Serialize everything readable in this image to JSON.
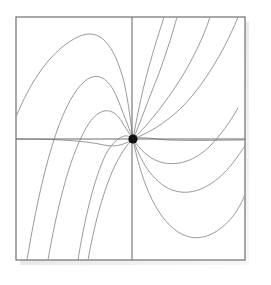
{
  "figure": {
    "title": "",
    "kind": "phase-portrait",
    "background_color": "#ffffff",
    "frame": {
      "x": 16,
      "y": 17,
      "width": 229,
      "height": 243,
      "border_color": "#6f6f6f",
      "fill_color": "#ffffff",
      "shadow_color": "#c9c9c9",
      "shadow_offset_x": 4,
      "shadow_offset_y": 5
    },
    "axes": {
      "color": "#6f6f6f",
      "x_axis_y": 139,
      "y_axis_x": 132,
      "stroke_width": 1.1
    },
    "singular_point": {
      "label": "origin",
      "x": 133,
      "y": 139,
      "radius": 4.6,
      "color": "#111111"
    },
    "curve_style": {
      "color": "#9a9a9a",
      "stroke_width": 1.0,
      "fill": "none"
    }
  },
  "chart_data": {
    "type": "line",
    "title": "",
    "xlabel": "",
    "ylabel": "",
    "grid": false,
    "legend": null,
    "xlim": [
      16,
      245
    ],
    "ylim": [
      260,
      17
    ],
    "origin": [
      133,
      139
    ],
    "series": [
      {
        "name": "upper-left-outer",
        "quadrant": "upper-left",
        "path": "M 16 117 C 30 82 52 48 80 36 C 100 28 114 44 124 82 C 129 104 131 126 133 139",
        "points": [
          [
            16,
            117
          ],
          [
            40,
            70
          ],
          [
            62,
            44
          ],
          [
            82,
            36
          ],
          [
            100,
            44
          ],
          [
            114,
            72
          ],
          [
            124,
            104
          ],
          [
            133,
            139
          ]
        ]
      },
      {
        "name": "upper-left-mid",
        "quadrant": "upper-left",
        "path": "M 27 260 C 37 200 52 128 74 94 C 92 66 108 74 118 100 C 126 120 130 131 133 139",
        "points": [
          [
            27,
            260
          ],
          [
            40,
            206
          ],
          [
            56,
            146
          ],
          [
            74,
            102
          ],
          [
            94,
            76
          ],
          [
            110,
            88
          ],
          [
            122,
            114
          ],
          [
            133,
            139
          ]
        ]
      },
      {
        "name": "upper-left-inner",
        "quadrant": "upper-left",
        "path": "M 48 260 C 56 214 68 160 86 128 C 100 104 114 108 122 122 C 128 132 131 136 133 139",
        "points": [
          [
            48,
            260
          ],
          [
            58,
            212
          ],
          [
            72,
            162
          ],
          [
            88,
            128
          ],
          [
            104,
            112
          ],
          [
            118,
            120
          ],
          [
            126,
            130
          ],
          [
            133,
            139
          ]
        ]
      },
      {
        "name": "upper-left-innermost",
        "quadrant": "upper-left",
        "path": "M 78 260 C 84 222 94 178 106 154 C 116 136 126 134 130 137 C 132 138 132 139 133 139",
        "points": [
          [
            78,
            260
          ],
          [
            86,
            220
          ],
          [
            96,
            180
          ],
          [
            108,
            154
          ],
          [
            120,
            140
          ],
          [
            128,
            137
          ],
          [
            133,
            139
          ]
        ]
      },
      {
        "name": "lower-left-outer",
        "quadrant": "lower-left",
        "path": "M 88 260 C 94 226 102 196 112 172 C 120 154 128 143 133 139",
        "points": [
          [
            88,
            260
          ],
          [
            96,
            224
          ],
          [
            106,
            190
          ],
          [
            116,
            164
          ],
          [
            126,
            147
          ],
          [
            133,
            139
          ]
        ]
      },
      {
        "name": "left-separatrix",
        "quadrant": "left",
        "path": "M 16 139 C 48 139 82 140 104 145 C 118 148 127 143 133 139",
        "points": [
          [
            16,
            139
          ],
          [
            48,
            139
          ],
          [
            78,
            141
          ],
          [
            100,
            146
          ],
          [
            118,
            146
          ],
          [
            133,
            139
          ]
        ]
      },
      {
        "name": "right-separatrix",
        "quadrant": "right",
        "path": "M 133 139 C 142 136 152 139 168 140 C 196 141 224 140 245 140",
        "points": [
          [
            133,
            139
          ],
          [
            148,
            138
          ],
          [
            168,
            140
          ],
          [
            200,
            141
          ],
          [
            245,
            140
          ]
        ]
      },
      {
        "name": "upper-right-innermost",
        "quadrant": "upper-right",
        "path": "M 133 139 C 136 122 141 96 148 70 C 154 48 160 30 164 17",
        "points": [
          [
            133,
            139
          ],
          [
            138,
            110
          ],
          [
            145,
            80
          ],
          [
            154,
            48
          ],
          [
            164,
            17
          ]
        ]
      },
      {
        "name": "upper-right-inner",
        "quadrant": "upper-right",
        "path": "M 133 139 C 140 124 148 100 158 76 C 166 54 173 32 177 17",
        "points": [
          [
            133,
            139
          ],
          [
            142,
            116
          ],
          [
            152,
            90
          ],
          [
            164,
            58
          ],
          [
            177,
            17
          ]
        ]
      },
      {
        "name": "upper-right-mid",
        "quadrant": "upper-right",
        "path": "M 133 139 C 145 128 160 110 176 86 C 192 62 204 36 210 17",
        "points": [
          [
            133,
            139
          ],
          [
            150,
            122
          ],
          [
            168,
            96
          ],
          [
            186,
            66
          ],
          [
            200,
            40
          ],
          [
            210,
            17
          ]
        ]
      },
      {
        "name": "upper-right-outer",
        "quadrant": "upper-right",
        "path": "M 133 139 C 152 132 174 118 192 96 C 212 72 228 42 238 17",
        "points": [
          [
            133,
            139
          ],
          [
            158,
            128
          ],
          [
            180,
            108
          ],
          [
            200,
            82
          ],
          [
            220,
            50
          ],
          [
            238,
            17
          ]
        ]
      },
      {
        "name": "lower-right-inner",
        "quadrant": "lower-right",
        "path": "M 133 139 C 140 150 150 160 164 163 C 182 166 198 158 210 146 C 220 136 230 122 238 108",
        "points": [
          [
            133,
            139
          ],
          [
            146,
            157
          ],
          [
            164,
            163
          ],
          [
            186,
            161
          ],
          [
            206,
            150
          ],
          [
            224,
            130
          ],
          [
            238,
            108
          ]
        ]
      },
      {
        "name": "lower-right-mid",
        "quadrant": "lower-right",
        "path": "M 133 139 C 140 160 152 182 172 190 C 194 198 216 184 232 164 C 238 156 242 150 245 146",
        "points": [
          [
            133,
            139
          ],
          [
            148,
            172
          ],
          [
            168,
            188
          ],
          [
            192,
            193
          ],
          [
            214,
            182
          ],
          [
            234,
            160
          ],
          [
            245,
            146
          ]
        ]
      },
      {
        "name": "lower-right-outer",
        "quadrant": "lower-right",
        "path": "M 133 139 C 140 176 154 216 178 232 C 200 246 222 232 236 212 C 241 204 244 198 245 194",
        "points": [
          [
            133,
            139
          ],
          [
            148,
            186
          ],
          [
            168,
            222
          ],
          [
            192,
            235
          ],
          [
            216,
            226
          ],
          [
            236,
            206
          ],
          [
            245,
            194
          ]
        ]
      }
    ]
  }
}
